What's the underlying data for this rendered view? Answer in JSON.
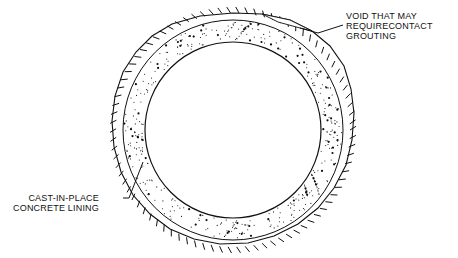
{
  "diagram": {
    "labels": {
      "void": {
        "lines": [
          "VOID THAT MAY",
          "REQUIRECONTACT",
          "GROUTING"
        ]
      },
      "lining": {
        "lines": [
          "CAST-IN-PLACE",
          "CONCRETE LINING"
        ]
      }
    },
    "geometry": {
      "center": [
        233,
        130
      ],
      "inner_radius": 88,
      "lining_outer_radius": 111,
      "excavation_radius": 118
    },
    "colors": {
      "line": "#111111",
      "background": "#ffffff"
    }
  }
}
